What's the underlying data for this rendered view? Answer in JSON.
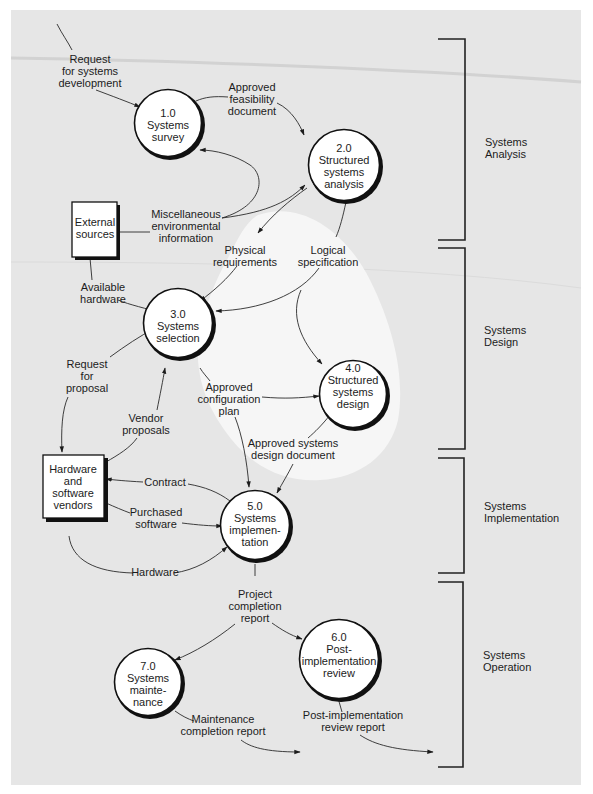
{
  "diagram": {
    "type": "data-flow-diagram",
    "colors": {
      "background": "#e6e6e6",
      "highlight_region": "#f4f4f4",
      "node_fill": "#ffffff",
      "stroke": "#111111"
    },
    "processes": [
      {
        "id": "p1",
        "number": "1.0",
        "lines": [
          "Systems",
          "survey"
        ]
      },
      {
        "id": "p2",
        "number": "2.0",
        "lines": [
          "Structured",
          "systems",
          "analysis"
        ]
      },
      {
        "id": "p3",
        "number": "3.0",
        "lines": [
          "Systems",
          "selection"
        ]
      },
      {
        "id": "p4",
        "number": "4.0",
        "lines": [
          "Structured",
          "systems",
          "design"
        ]
      },
      {
        "id": "p5",
        "number": "5.0",
        "lines": [
          "Systems",
          "implemen-",
          "tation"
        ]
      },
      {
        "id": "p6",
        "number": "6.0",
        "lines": [
          "Post-",
          "implementation",
          "review"
        ]
      },
      {
        "id": "p7",
        "number": "7.0",
        "lines": [
          "Systems",
          "mainte-",
          "nance"
        ]
      }
    ],
    "external_entities": [
      {
        "id": "e1",
        "lines": [
          "External",
          "sources"
        ]
      },
      {
        "id": "e2",
        "lines": [
          "Hardware",
          "and",
          "software",
          "vendors"
        ]
      }
    ],
    "flows": [
      {
        "lines": [
          "Request",
          "for systems",
          "development"
        ],
        "from": "",
        "to": "p1"
      },
      {
        "lines": [
          "Approved",
          "feasibility",
          "document"
        ],
        "from": "p1",
        "to": "p2"
      },
      {
        "lines": [
          "Miscellaneous",
          "environmental",
          "information"
        ],
        "from": "e1",
        "to": "p1, p2"
      },
      {
        "lines": [
          "Physical",
          "requirements"
        ],
        "from": "p2",
        "to": "p3"
      },
      {
        "lines": [
          "Logical",
          "specification"
        ],
        "from": "p2",
        "to": "p3, p4"
      },
      {
        "lines": [
          "Available",
          "hardware"
        ],
        "from": "e1",
        "to": "p3"
      },
      {
        "lines": [
          "Request",
          "for",
          "proposal"
        ],
        "from": "p3",
        "to": "e2"
      },
      {
        "lines": [
          "Vendor",
          "proposals"
        ],
        "from": "e2",
        "to": "p3"
      },
      {
        "lines": [
          "Approved",
          "configuration",
          "plan"
        ],
        "from": "p3",
        "to": "p4, p5"
      },
      {
        "lines": [
          "Approved systems",
          "design document"
        ],
        "from": "p4",
        "to": "p5"
      },
      {
        "lines": [
          "Contract"
        ],
        "from": "p5",
        "to": "e2"
      },
      {
        "lines": [
          "Purchased",
          "software"
        ],
        "from": "e2",
        "to": "p5"
      },
      {
        "lines": [
          "Hardware"
        ],
        "from": "e2",
        "to": "p5"
      },
      {
        "lines": [
          "Project",
          "completion",
          "report"
        ],
        "from": "p5",
        "to": "p6, p7"
      },
      {
        "lines": [
          "Maintenance",
          "completion report"
        ],
        "from": "p7",
        "to": ""
      },
      {
        "lines": [
          "Post-implementation",
          "review report"
        ],
        "from": "p6",
        "to": ""
      }
    ],
    "phases": [
      {
        "lines": [
          "Systems",
          "Analysis"
        ]
      },
      {
        "lines": [
          "Systems",
          "Design"
        ]
      },
      {
        "lines": [
          "Systems",
          "Implementation"
        ]
      },
      {
        "lines": [
          "Systems",
          "Operation"
        ]
      }
    ]
  }
}
